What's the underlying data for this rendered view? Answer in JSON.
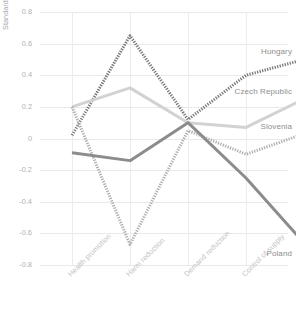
{
  "chart_data": {
    "type": "line",
    "title": "",
    "xlabel": "",
    "ylabel": "Standard score",
    "ylim": [
      -0.8,
      0.8
    ],
    "ytick_labels": [
      "0.8",
      "0.6",
      "0.4",
      "0.2",
      "0",
      "-0.2",
      "-0.4",
      "-0.6",
      "-0.8"
    ],
    "ytick_values": [
      0.8,
      0.6,
      0.4,
      0.2,
      0,
      -0.2,
      -0.4,
      -0.6,
      -0.8
    ],
    "grid": true,
    "legend": "inline-right-endpoint-labels",
    "categories": [
      "Health promotion",
      "Harm reduction",
      "Demand reduction",
      "Control of supply",
      "Law enforcement"
    ],
    "series": [
      {
        "name": "Hungary",
        "color": "#7a7a7a",
        "style": "dotted-thick",
        "values": [
          0.02,
          0.65,
          0.12,
          0.4,
          0.5
        ]
      },
      {
        "name": "Czech Republic",
        "color": "#d2d2d2",
        "style": "solid-thick",
        "values": [
          0.2,
          0.32,
          0.1,
          0.07,
          0.25
        ]
      },
      {
        "name": "Slovenia",
        "color": "#b0b0b0",
        "style": "dotted-thick",
        "values": [
          0.2,
          -0.67,
          0.05,
          -0.1,
          0.03
        ]
      },
      {
        "name": "Poland",
        "color": "#8c8c8c",
        "style": "solid-thick",
        "values": [
          -0.09,
          -0.14,
          0.1,
          -0.25,
          -0.66
        ]
      }
    ]
  }
}
